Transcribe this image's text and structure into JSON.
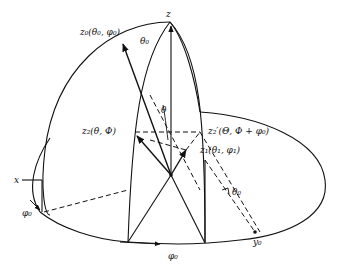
{
  "figure": {
    "colors": {
      "ink": "#111111",
      "background": "#ffffff"
    }
  },
  "labels": {
    "z_axis": "z",
    "x_axis": "x",
    "y0_axis": "y₀",
    "z0_point": "z₀(θ₀, φ₀)",
    "theta0_top": "θ₀",
    "theta_center": "θ",
    "z2_point": "z₂(θ, Φ)",
    "z2prime_point": "z₂′(Θ, Φ + φ₀)",
    "z1_point": "z₁(θ₁, φ₁)",
    "theta0_right": "θ₀",
    "phi0_left": "φ₀",
    "phi0_bottom": "φ₀"
  }
}
